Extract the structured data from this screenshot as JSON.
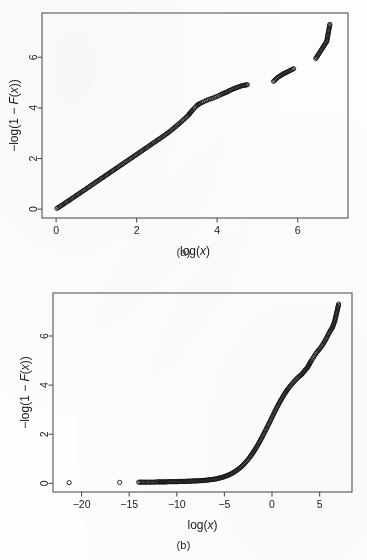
{
  "figure": {
    "background_color": "#fdfdfb",
    "ink_color": "#1a1a1a",
    "panel_a_caption": "(a)",
    "panel_b_caption": "(b)"
  },
  "chart_data": [
    {
      "id": "panel-a",
      "type": "scatter",
      "title": "",
      "subtitle": "",
      "caption": "(a)",
      "xlabel": "log(x)",
      "ylabel": "−log(1 − F(x))",
      "xlim": [
        -0.35,
        7.25
      ],
      "ylim": [
        -0.35,
        7.75
      ],
      "xticks": [
        0,
        2,
        4,
        6
      ],
      "xticklabels": [
        "0",
        "2",
        "4",
        "6"
      ],
      "yticks": [
        0,
        2,
        4,
        6
      ],
      "yticklabels": [
        "0",
        "2",
        "4",
        "6"
      ],
      "grid": false,
      "legend": null,
      "marker": "open-circle",
      "marker_size": 2.1,
      "annotations": [],
      "description": "Near-linear exponential QQ / mean-excess tail plot; dense overlapping points along a straight line of slope ~1 from (0,0) to about (4.3,4.7), then sparse isolated open circles out to (6.8,7.3).",
      "x": [
        0.02,
        0.05,
        0.08,
        0.11,
        0.14,
        0.17,
        0.2,
        0.23,
        0.26,
        0.29,
        0.32,
        0.35,
        0.38,
        0.41,
        0.44,
        0.47,
        0.5,
        0.53,
        0.56,
        0.59,
        0.62,
        0.65,
        0.68,
        0.71,
        0.74,
        0.77,
        0.8,
        0.83,
        0.86,
        0.89,
        0.92,
        0.95,
        0.98,
        1.01,
        1.04,
        1.07,
        1.1,
        1.13,
        1.16,
        1.19,
        1.22,
        1.25,
        1.28,
        1.31,
        1.34,
        1.37,
        1.4,
        1.43,
        1.46,
        1.49,
        1.52,
        1.55,
        1.58,
        1.61,
        1.64,
        1.67,
        1.7,
        1.73,
        1.76,
        1.79,
        1.82,
        1.85,
        1.88,
        1.91,
        1.94,
        1.97,
        2.0,
        2.03,
        2.06,
        2.09,
        2.12,
        2.15,
        2.18,
        2.21,
        2.24,
        2.27,
        2.3,
        2.33,
        2.36,
        2.39,
        2.42,
        2.45,
        2.48,
        2.51,
        2.54,
        2.57,
        2.6,
        2.63,
        2.66,
        2.69,
        2.72,
        2.75,
        2.78,
        2.81,
        2.84,
        2.87,
        2.9,
        2.93,
        2.96,
        2.99,
        3.02,
        3.05,
        3.08,
        3.11,
        3.14,
        3.17,
        3.2,
        3.23,
        3.26,
        3.29,
        3.32,
        3.35,
        3.38,
        3.41,
        3.44,
        3.47,
        3.5,
        3.54,
        3.58,
        3.62,
        3.66,
        3.7,
        3.74,
        3.78,
        3.82,
        3.86,
        3.9,
        3.94,
        3.98,
        4.02,
        4.06,
        4.1,
        4.15,
        4.2,
        4.25,
        4.3,
        4.45,
        4.62,
        4.7,
        4.75,
        5.4,
        5.5,
        5.58,
        5.65,
        5.78,
        5.9,
        6.45,
        6.55,
        6.72,
        6.8
      ],
      "y": [
        0.03,
        0.06,
        0.09,
        0.12,
        0.15,
        0.18,
        0.21,
        0.25,
        0.28,
        0.31,
        0.34,
        0.37,
        0.41,
        0.44,
        0.47,
        0.5,
        0.54,
        0.57,
        0.6,
        0.63,
        0.66,
        0.7,
        0.73,
        0.76,
        0.79,
        0.83,
        0.86,
        0.89,
        0.93,
        0.96,
        0.99,
        1.02,
        1.06,
        1.09,
        1.12,
        1.15,
        1.19,
        1.22,
        1.25,
        1.28,
        1.32,
        1.35,
        1.38,
        1.41,
        1.45,
        1.48,
        1.51,
        1.54,
        1.58,
        1.61,
        1.64,
        1.67,
        1.71,
        1.74,
        1.77,
        1.8,
        1.84,
        1.87,
        1.9,
        1.93,
        1.97,
        2.0,
        2.03,
        2.06,
        2.1,
        2.13,
        2.16,
        2.19,
        2.23,
        2.26,
        2.29,
        2.32,
        2.36,
        2.39,
        2.42,
        2.45,
        2.49,
        2.52,
        2.55,
        2.59,
        2.62,
        2.65,
        2.68,
        2.72,
        2.75,
        2.78,
        2.81,
        2.85,
        2.88,
        2.91,
        2.95,
        2.98,
        3.02,
        3.05,
        3.09,
        3.13,
        3.17,
        3.21,
        3.25,
        3.29,
        3.33,
        3.37,
        3.41,
        3.45,
        3.5,
        3.54,
        3.58,
        3.63,
        3.67,
        3.72,
        3.78,
        3.84,
        3.9,
        3.95,
        4.0,
        4.05,
        4.1,
        4.14,
        4.18,
        4.21,
        4.24,
        4.27,
        4.3,
        4.32,
        4.35,
        4.37,
        4.39,
        4.42,
        4.44,
        4.47,
        4.5,
        4.53,
        4.57,
        4.6,
        4.63,
        4.68,
        4.78,
        4.88,
        4.9,
        4.92,
        5.05,
        5.2,
        5.28,
        5.35,
        5.45,
        5.55,
        5.95,
        6.2,
        6.62,
        7.3
      ]
    },
    {
      "id": "panel-b",
      "type": "scatter",
      "title": "",
      "subtitle": "",
      "caption": "(b)",
      "xlabel": "log(x)",
      "ylabel": "−log(1 − F(x))",
      "xlim": [
        -23.0,
        8.4
      ],
      "ylim": [
        -0.35,
        7.75
      ],
      "xticks": [
        -20,
        -15,
        -10,
        -5,
        0,
        5
      ],
      "xticklabels": [
        "−20",
        "−15",
        "−10",
        "−5",
        "0",
        "5"
      ],
      "yticks": [
        0,
        2,
        4,
        6
      ],
      "yticklabels": [
        "0",
        "2",
        "4",
        "6"
      ],
      "grid": false,
      "legend": null,
      "marker": "open-circle",
      "marker_size": 2.1,
      "annotations": [],
      "description": "Strongly convex tail plot: isolated points near y=0 at log(x) = -21.3, -16.0, -14.0, then a dense flat band along y≈0 from -13 to about -5, curving upward steeply after x≈-2 and rising to (7.0, 7.3).",
      "x": [
        -21.3,
        -16.0,
        -14.0,
        -13.1,
        -12.7,
        -12.4,
        -12.1,
        -11.9,
        -11.7,
        -11.5,
        -11.3,
        -11.1,
        -10.9,
        -10.7,
        -10.5,
        -10.3,
        -10.1,
        -9.9,
        -9.7,
        -9.5,
        -9.3,
        -9.1,
        -8.9,
        -8.7,
        -8.5,
        -8.3,
        -8.1,
        -7.9,
        -7.7,
        -7.5,
        -7.3,
        -7.1,
        -6.9,
        -6.7,
        -6.5,
        -6.3,
        -6.1,
        -5.9,
        -5.7,
        -5.5,
        -5.3,
        -5.1,
        -4.9,
        -4.7,
        -4.5,
        -4.3,
        -4.1,
        -3.9,
        -3.7,
        -3.5,
        -3.3,
        -3.1,
        -2.9,
        -2.7,
        -2.5,
        -2.3,
        -2.1,
        -1.9,
        -1.7,
        -1.5,
        -1.3,
        -1.1,
        -0.9,
        -0.7,
        -0.5,
        -0.3,
        -0.1,
        0.1,
        0.3,
        0.5,
        0.7,
        0.9,
        1.1,
        1.3,
        1.5,
        1.7,
        1.9,
        2.1,
        2.3,
        2.5,
        2.7,
        2.9,
        3.1,
        3.25,
        3.4,
        3.55,
        3.7,
        3.8,
        3.9,
        4.0,
        4.1,
        4.2,
        4.3,
        4.4,
        4.5,
        4.6,
        4.7,
        4.8,
        4.9,
        5.0,
        5.1,
        5.2,
        5.35,
        5.5,
        5.7,
        5.9,
        6.1,
        6.35,
        6.6,
        7.0
      ],
      "y": [
        0.03,
        0.04,
        0.05,
        0.05,
        0.05,
        0.05,
        0.06,
        0.06,
        0.06,
        0.06,
        0.06,
        0.06,
        0.07,
        0.07,
        0.07,
        0.07,
        0.07,
        0.07,
        0.08,
        0.08,
        0.08,
        0.08,
        0.09,
        0.09,
        0.09,
        0.1,
        0.1,
        0.1,
        0.11,
        0.11,
        0.12,
        0.12,
        0.13,
        0.14,
        0.15,
        0.16,
        0.17,
        0.18,
        0.2,
        0.22,
        0.24,
        0.26,
        0.29,
        0.32,
        0.35,
        0.39,
        0.43,
        0.48,
        0.53,
        0.59,
        0.65,
        0.72,
        0.8,
        0.89,
        0.98,
        1.08,
        1.19,
        1.31,
        1.43,
        1.56,
        1.7,
        1.84,
        1.99,
        2.14,
        2.3,
        2.45,
        2.61,
        2.77,
        2.93,
        3.08,
        3.23,
        3.37,
        3.5,
        3.63,
        3.75,
        3.86,
        3.96,
        4.05,
        4.14,
        4.22,
        4.3,
        4.37,
        4.43,
        4.5,
        4.57,
        4.64,
        4.7,
        4.77,
        4.84,
        4.91,
        4.98,
        5.04,
        5.1,
        5.16,
        5.22,
        5.28,
        5.33,
        5.38,
        5.43,
        5.47,
        5.52,
        5.58,
        5.66,
        5.76,
        5.9,
        6.05,
        6.2,
        6.35,
        6.62,
        7.3
      ]
    }
  ]
}
